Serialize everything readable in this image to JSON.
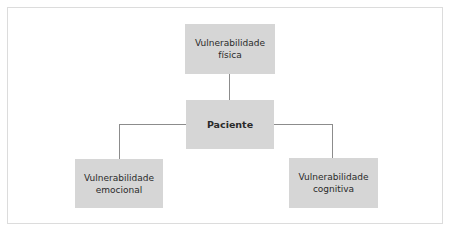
{
  "diagram": {
    "type": "hierarchy",
    "center": {
      "label": "Paciente"
    },
    "nodes": [
      {
        "id": "fisica",
        "label": "Vulnerabilidade\nfísica",
        "position": "top"
      },
      {
        "id": "emocional",
        "label": "Vulnerabilidade\nemocional",
        "position": "bottom-left"
      },
      {
        "id": "cognitiva",
        "label": "Vulnerabilidade\ncognitiva",
        "position": "bottom-right"
      }
    ],
    "edges": [
      {
        "from": "Paciente",
        "to": "Vulnerabilidade física"
      },
      {
        "from": "Paciente",
        "to": "Vulnerabilidade emocional"
      },
      {
        "from": "Paciente",
        "to": "Vulnerabilidade cognitiva"
      }
    ],
    "colors": {
      "node_fill": "#d6d6d6",
      "connector": "#8c8c8c",
      "text": "#2a2a2a",
      "frame_border": "#dcdcdc"
    }
  }
}
